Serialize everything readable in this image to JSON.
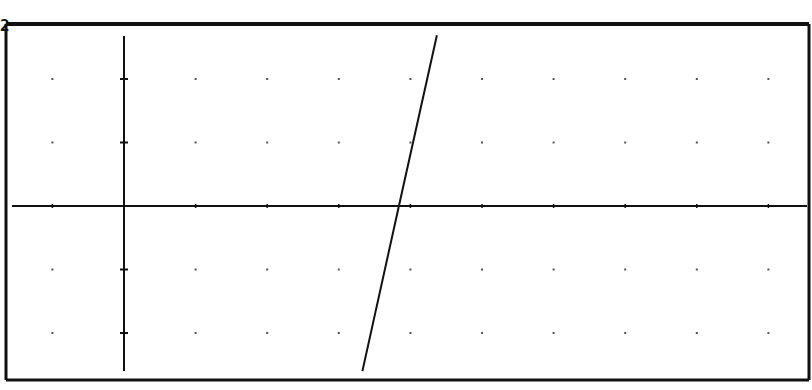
{
  "screen": {
    "type": "graphing-calculator-graph",
    "busy_indicator": "2",
    "colors": {
      "background": "#ffffff",
      "ink": "#111111",
      "grid": "#555555"
    }
  },
  "chart_data": {
    "type": "line",
    "title": "",
    "xlabel": "",
    "ylabel": "",
    "grid": "dots",
    "xlim": [
      -1.65,
      9.57
    ],
    "ylim": [
      -2.74,
      2.87
    ],
    "xscl": 1,
    "yscl": 1,
    "series": [
      {
        "name": "Y1",
        "x": [
          4.37,
          3.84,
          3.33
        ],
        "y": [
          2.69,
          0.0,
          -2.6
        ]
      }
    ],
    "annotations": []
  },
  "layout": {
    "frame": {
      "left": 6,
      "top": 24,
      "right": 809,
      "bottom": 380
    },
    "origin_px": [
      124,
      206
    ],
    "px_per_x_unit": 71.6,
    "px_per_y_unit": 63.5
  }
}
